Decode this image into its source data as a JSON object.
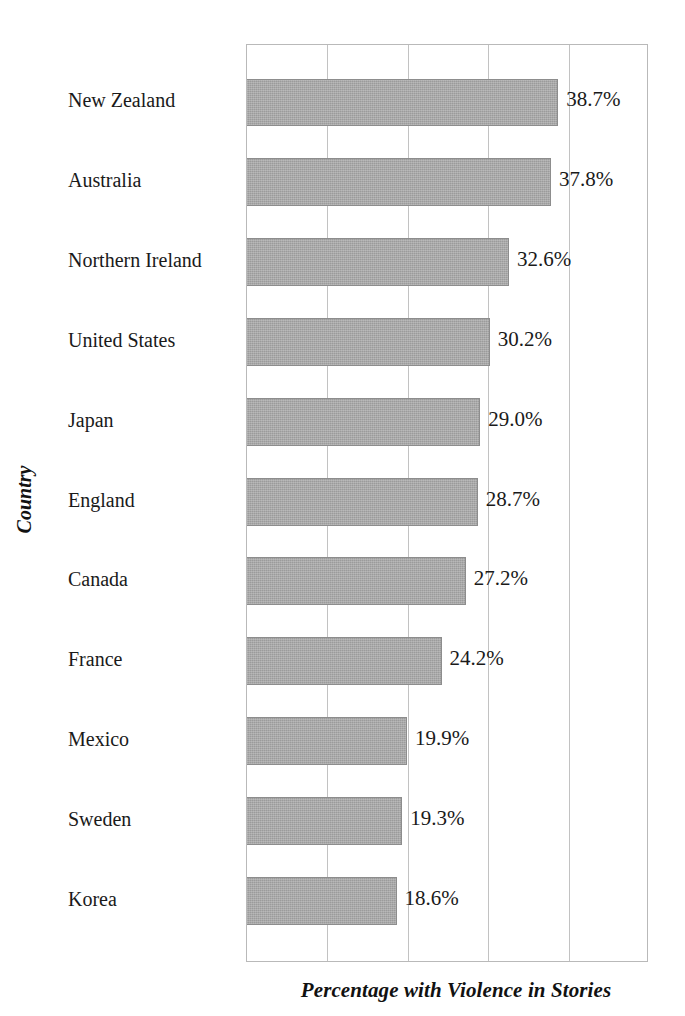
{
  "chart_data": {
    "type": "bar",
    "orientation": "horizontal",
    "title": "",
    "xlabel": "Percentage with Violence in Stories",
    "ylabel": "Country",
    "xlim": [
      0,
      50
    ],
    "grid": true,
    "legend": false,
    "xticks": [
      "0",
      "10",
      "20",
      "30",
      "40",
      "50"
    ],
    "xtick_labels_visible": false,
    "value_label_suffix": "%",
    "bar_color": "#9b9b9b",
    "frame_color": "#b9b9b9",
    "categories": [
      "New Zealand",
      "Australia",
      "Northern Ireland",
      "United States",
      "Japan",
      "England",
      "Canada",
      "France",
      "Mexico",
      "Sweden",
      "Korea"
    ],
    "values": [
      38.7,
      37.8,
      32.6,
      30.2,
      29.0,
      28.7,
      27.2,
      24.2,
      19.9,
      19.3,
      18.6
    ],
    "value_labels": [
      "38.7%",
      "37.8%",
      "32.6%",
      "30.2%",
      "29.0%",
      "28.7%",
      "27.2%",
      "24.2%",
      "19.9%",
      "19.3%",
      "18.6%"
    ]
  }
}
